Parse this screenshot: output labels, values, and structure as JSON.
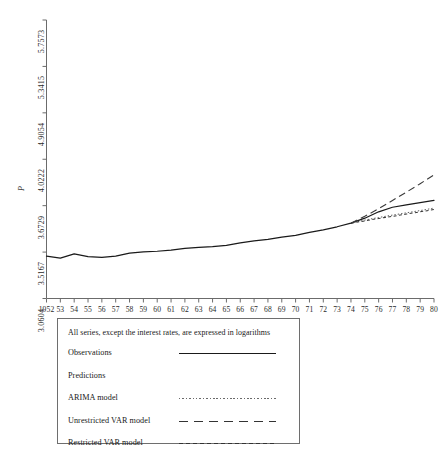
{
  "chart_data": {
    "type": "line",
    "title": "",
    "xlabel": "",
    "ylabel": "P",
    "xlim": [
      1952,
      1980
    ],
    "ylim": [
      3.0604,
      5.7573
    ],
    "grid": false,
    "legend_position": "below-plot",
    "x_tick_labels": [
      "1952",
      "53",
      "54",
      "55",
      "56",
      "57",
      "58",
      "59",
      "60",
      "61",
      "62",
      "63",
      "64",
      "65",
      "66",
      "67",
      "68",
      "69",
      "70",
      "71",
      "72",
      "73",
      "74",
      "75",
      "76",
      "77",
      "78",
      "79",
      "80"
    ],
    "y_tick_labels": [
      "5.7573",
      "5.3415",
      "4.9054",
      "4.0222",
      "3.6729",
      "3.5167",
      "3.0604"
    ],
    "y_tick_values": [
      5.7573,
      5.3415,
      4.9054,
      4.0222,
      3.6729,
      3.5167,
      3.0604
    ],
    "x": [
      1952,
      1953,
      1954,
      1955,
      1956,
      1957,
      1958,
      1959,
      1960,
      1961,
      1962,
      1963,
      1964,
      1965,
      1966,
      1967,
      1968,
      1969,
      1970,
      1971,
      1972,
      1973,
      1974,
      1975,
      1976,
      1977,
      1978,
      1979,
      1980
    ],
    "series": [
      {
        "name": "Observations",
        "style": "solid",
        "color": "#1a1a1a",
        "values": [
          3.47,
          3.452,
          3.492,
          3.465,
          3.458,
          3.47,
          3.5,
          3.512,
          3.518,
          3.529,
          3.545,
          3.555,
          3.562,
          3.575,
          3.6,
          3.618,
          3.632,
          3.655,
          3.672,
          3.7,
          3.726,
          3.755,
          3.79,
          3.838,
          3.9,
          3.944,
          3.968,
          3.988,
          4.01
        ],
        "values_note": "Solid historical line over full 1952-1980 span; continues through the forecast window."
      },
      {
        "name": "ARIMA model",
        "style": "dotted",
        "color": "#5a5a5a",
        "x_start": 1974,
        "values": [
          3.79,
          3.82,
          3.845,
          3.868,
          3.89,
          3.912,
          3.936
        ],
        "x": [
          1974,
          1975,
          1976,
          1977,
          1978,
          1979,
          1980
        ]
      },
      {
        "name": "Unrestricted VAR model",
        "style": "long-dash",
        "color": "#3a3a3a",
        "x_start": 1974,
        "values": [
          3.79,
          3.856,
          3.93,
          4.01,
          4.09,
          4.172,
          4.258
        ],
        "x": [
          1974,
          1975,
          1976,
          1977,
          1978,
          1979,
          1980
        ]
      },
      {
        "name": "Restricted VAR model",
        "style": "short-dash",
        "color": "#3a3a3a",
        "x_start": 1974,
        "values": [
          3.79,
          3.812,
          3.835,
          3.856,
          3.878,
          3.9,
          3.922
        ],
        "x": [
          1974,
          1975,
          1976,
          1977,
          1978,
          1979,
          1980
        ]
      }
    ],
    "annotations": [
      "All series, except the interest rates, are expressed in logarithms"
    ]
  },
  "legend": {
    "note": "All series, except the interest rates, are expressed in logarithms",
    "rows": [
      {
        "label": "Observations",
        "style": "solid"
      },
      {
        "label": "Predictions",
        "style": "none"
      },
      {
        "label": "ARIMA model",
        "style": "dotted"
      },
      {
        "label": "Unrestricted VAR model",
        "style": "long-dash"
      },
      {
        "label": "Restricted VAR model",
        "style": "short-dash"
      }
    ]
  },
  "axis": {
    "y_label": "P"
  }
}
